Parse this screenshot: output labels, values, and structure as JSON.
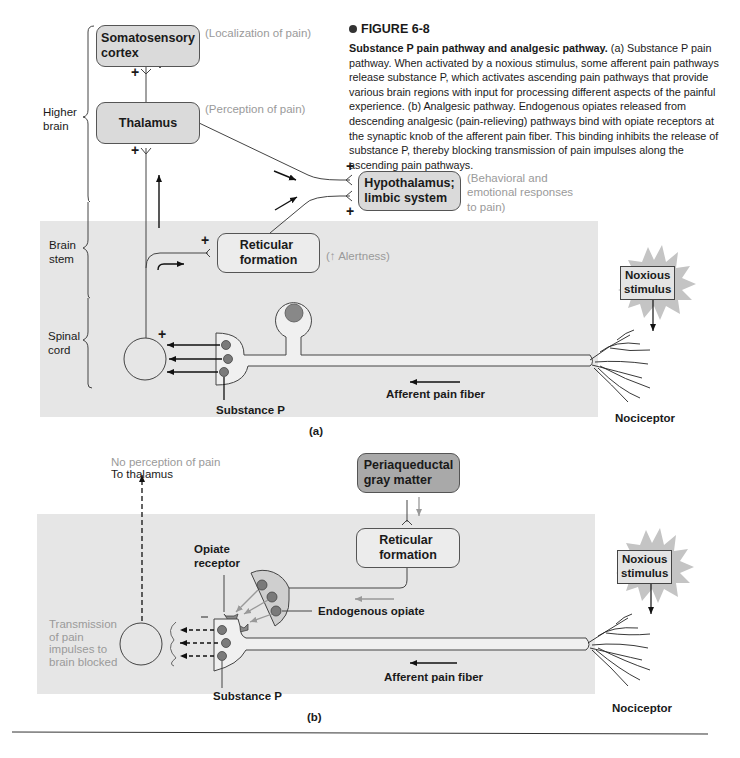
{
  "caption": {
    "figure_label": "FIGURE 6-8",
    "title": "Substance P pain pathway and analgesic pathway.",
    "body": " (a) Substance P pain pathway. When activated by a noxious stimulus, some afferent pain pathways release substance P, which activates ascending pain pathways that provide various brain regions with input for processing different aspects of the painful experience. (b) Analgesic pathway. Endogenous opiates released from descending analgesic (pain-relieving) pathways bind with opiate receptors at the synaptic knob of the afferent pain fiber. This binding inhibits the release of substance P, thereby blocking transmission of pain impulses along the ascending pain pathways."
  },
  "panel_a": {
    "region_labels": {
      "higher_brain": "Higher\nbrain",
      "brain_stem": "Brain\nstem",
      "spinal_cord": "Spinal\ncord"
    },
    "boxes": {
      "somatosensory": "Somatosensory\ncortex",
      "thalamus": "Thalamus",
      "hypothalamus": "Hypothalamus;\nlimbic system",
      "reticular": "Reticular\nformation",
      "noxious": "Noxious\nstimulus"
    },
    "annotations": {
      "localization": "(Localization of pain)",
      "perception": "(Perception of pain)",
      "behavioral": "(Behavioral and\nemotional responses\nto pain)",
      "alertness": "(↑ Alertness)"
    },
    "labels": {
      "substance_p": "Substance P",
      "afferent": "Afferent pain fiber",
      "nociceptor": "Nociceptor",
      "plus": "+",
      "panel_tag": "(a)"
    }
  },
  "panel_b": {
    "boxes": {
      "periaqueductal": "Periaqueductal\ngray matter",
      "reticular": "Reticular\nformation",
      "noxious": "Noxious\nstimulus"
    },
    "labels": {
      "no_perception": "No perception of pain",
      "to_thalamus": "To thalamus",
      "opiate_receptor": "Opiate\nreceptor",
      "endogenous_opiate": "Endogenous opiate",
      "transmission_blocked": "Transmission\nof pain\nimpulses to\nbrain blocked",
      "substance_p": "Substance P",
      "afferent": "Afferent pain fiber",
      "nociceptor": "Nociceptor",
      "minus": "–",
      "panel_tag": "(b)"
    }
  },
  "colors": {
    "panel_bg": "#e6e6e6",
    "box_fill": "#dadada",
    "dark_box_fill": "#a9a9a9",
    "annotation_gray": "#9a9a9a",
    "vesicle": "#7a7a7a"
  }
}
